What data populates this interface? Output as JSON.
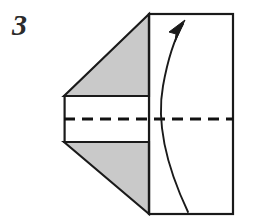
{
  "figure": {
    "kind": "origami-fold-diagram",
    "step_number": "3",
    "caption": "",
    "colors": {
      "paper_front": "#ffffff",
      "paper_shaded": "#c9c9c9",
      "outline": "#1a1a1a",
      "crease_dashed": "#111111",
      "arrow": "#1a1a1a",
      "background": "#ffffff",
      "step_number_color": "#2b2b2b"
    },
    "geometry": {
      "rectangle": {
        "name": "main-panel",
        "left": 149,
        "top": 14,
        "right": 233,
        "bottom": 214
      },
      "upper_shaded_triangle": {
        "name": "upper-flap",
        "points": "64,96 149,14 149,96"
      },
      "lower_shaded_triangle": {
        "name": "lower-flap",
        "points": "64,142 149,214 149,142"
      },
      "middle_band": {
        "name": "middle-band",
        "points": "64,96 149,96 149,142 64,142"
      },
      "left_edge_x": 64,
      "band_top_y": 96,
      "band_bottom_y": 142,
      "crease_line": {
        "name": "valley-crease",
        "x1": 64,
        "y1": 119,
        "x2": 233,
        "y2": 119,
        "dash_pattern": "11 7",
        "stroke_width": 3.2
      },
      "arrow": {
        "name": "fold-arrow",
        "path": "M 188 212 C 171 176 155 130 163 86 C 168 58 176 36 183 24",
        "tip_x": 184,
        "tip_y": 21,
        "head_points": "184,21 171,33 177,34 176,41",
        "stroke_width": 1.9
      }
    },
    "labels": {
      "upper_flap": "upper-flap",
      "lower_flap": "lower-flap",
      "main_panel": "main-panel",
      "crease": "valley-crease",
      "arrow": "fold-arrow"
    }
  }
}
